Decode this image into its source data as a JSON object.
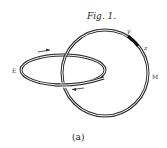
{
  "figure": {
    "title": "Fig. 1.",
    "caption": "(a)",
    "labels": {
      "E": "E",
      "M": "M",
      "y": "y",
      "z": "z"
    },
    "colors": {
      "ink": "#2a2a2a",
      "background": "#ffffff"
    }
  }
}
